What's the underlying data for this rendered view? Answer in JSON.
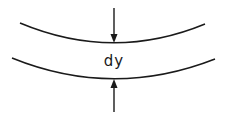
{
  "diagram": {
    "title": "",
    "elements": {
      "upper_surface": "curved surface (upper)",
      "lower_surface": "curved surface (lower)",
      "top_arrow": "dimension arrow pointing down",
      "bottom_arrow": "dimension arrow pointing up"
    },
    "label": "dy",
    "colors": {
      "stroke": "#1a1a1a",
      "background": "#ffffff"
    }
  }
}
